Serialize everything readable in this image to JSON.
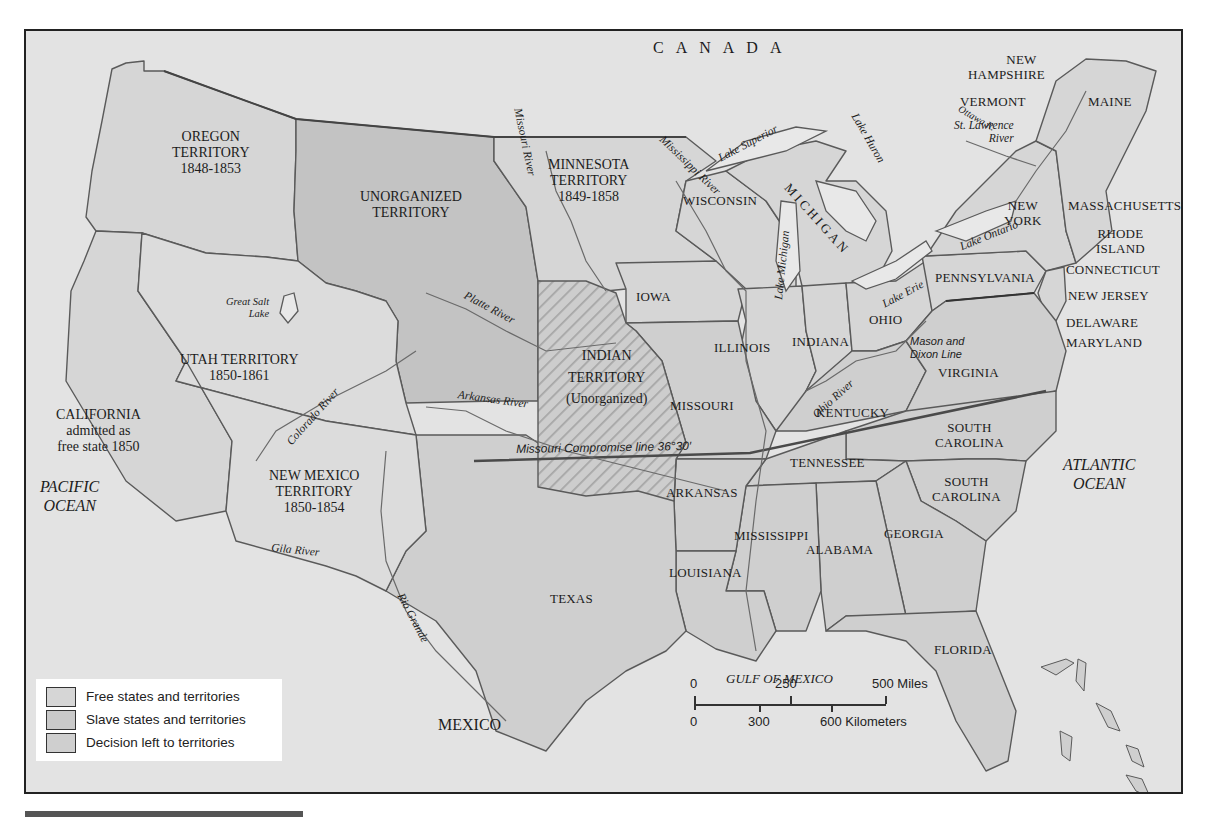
{
  "colors": {
    "ocean_foreign": "#e3e3e3",
    "free": "#d6d6d6",
    "slave": "#cfcfcf",
    "decision": "#c3c3c3",
    "border": "#555555",
    "frame": "#222222"
  },
  "countries": {
    "canada": "CANADA",
    "mexico": "MEXICO"
  },
  "oceans": {
    "pacific": [
      "PACIFIC",
      "OCEAN"
    ],
    "atlantic": [
      "ATLANTIC",
      "OCEAN"
    ],
    "gulf": "GULF OF MEXICO"
  },
  "territories": {
    "oregon": [
      "OREGON",
      "TERRITORY",
      "1848-1853"
    ],
    "unorganized": [
      "UNORGANIZED",
      "TERRITORY"
    ],
    "minnesota": [
      "MINNESOTA",
      "TERRITORY",
      "1849-1858"
    ],
    "utah": [
      "UTAH TERRITORY",
      "1850-1861"
    ],
    "new_mexico": [
      "NEW MEXICO",
      "TERRITORY",
      "1850-1854"
    ],
    "indian": [
      "INDIAN",
      "TERRITORY",
      "(Unorganized)"
    ],
    "california": [
      "CALIFORNIA",
      "admitted as",
      "free state 1850"
    ]
  },
  "states": {
    "wisconsin": "WISCONSIN",
    "michigan": "MICHIGAN",
    "iowa": "IOWA",
    "illinois": "ILLINOIS",
    "indiana": "INDIANA",
    "ohio": "OHIO",
    "pennsylvania": "PENNSYLVANIA",
    "new_york": [
      "NEW",
      "YORK"
    ],
    "vermont": "VERMONT",
    "new_hampshire": [
      "NEW",
      "HAMPSHIRE"
    ],
    "maine": "MAINE",
    "massachusetts": "MASSACHUSETTS",
    "rhode_island": [
      "RHODE",
      "ISLAND"
    ],
    "connecticut": "CONNECTICUT",
    "new_jersey": "NEW JERSEY",
    "delaware": "DELAWARE",
    "maryland": "MARYLAND",
    "virginia": "VIRGINIA",
    "kentucky": "KENTUCKY",
    "missouri": "MISSOURI",
    "tennessee": "TENNESSEE",
    "north_carolina_label": [
      "SOUTH",
      "CAROLINA"
    ],
    "south_carolina": [
      "SOUTH",
      "CAROLINA"
    ],
    "arkansas": "ARKANSAS",
    "mississippi": "MISSISSIPPI",
    "alabama": "ALABAMA",
    "georgia": "GEORGIA",
    "louisiana": "LOUISIANA",
    "florida": "FLORIDA",
    "texas": "TEXAS"
  },
  "water_features": {
    "missouri_river": "Missouri River",
    "mississippi_river": "Mississippi River",
    "platte_river": "Platte River",
    "arkansas_river": "Arkansas River",
    "colorado_river": "Colorado River",
    "gila_river": "Gila River",
    "rio_grande": "Rio Grande",
    "ohio_river": "Ohio River",
    "ottawa_river": "Ottawa R.",
    "st_lawrence": [
      "St. Lawrence",
      "River"
    ],
    "great_salt_lake": [
      "Great Salt",
      "Lake"
    ],
    "lake_superior": "Lake Superior",
    "lake_michigan": "Lake Michigan",
    "lake_huron": "Lake Huron",
    "lake_erie": "Lake Erie",
    "lake_ontario": "Lake Ontario"
  },
  "lines": {
    "missouri_compromise": "Missouri  Compromise line 36°30′",
    "mason_dixon": [
      "Mason and",
      "Dixon Line"
    ]
  },
  "legend": {
    "items": [
      {
        "label": "Free states and territories",
        "color": "#d6d6d6"
      },
      {
        "label": "Slave states and territories",
        "color": "#cfcfcf"
      },
      {
        "label": "Decision left to territories",
        "color": "#c3c3c3"
      }
    ]
  },
  "scale": {
    "miles": [
      "0",
      "250",
      "500 Miles"
    ],
    "km": [
      "0",
      "300",
      "600 Kilometers"
    ]
  }
}
